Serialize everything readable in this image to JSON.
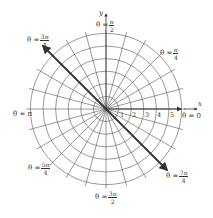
{
  "diagram": {
    "type": "polar-coordinate-grid",
    "center": {
      "x": 106,
      "y": 109
    },
    "unit_px": 12.6,
    "circle_count": 6,
    "radial_line_count": 24,
    "radial_step_degrees": 15,
    "colors": {
      "grid": "#555555",
      "axis": "#333333",
      "arrow": "#333333",
      "text": "#333333",
      "background": "#ffffff"
    },
    "axes": {
      "x_label": "x",
      "y_label": "y"
    },
    "ticks": [
      "1",
      "2",
      "3",
      "4",
      "5"
    ],
    "angle_labels": [
      {
        "id": "theta-pi-over-2",
        "prefix": "θ =",
        "num": "π",
        "den": "2",
        "angle": "π/2"
      },
      {
        "id": "theta-pi-over-4",
        "prefix": "θ =",
        "num": "π",
        "den": "4",
        "angle": "π/4"
      },
      {
        "id": "theta-3pi-over-4",
        "prefix": "θ =",
        "num": "3π",
        "den": "4",
        "angle": "3π/4"
      },
      {
        "id": "theta-pi",
        "text": "θ = π",
        "angle": "π"
      },
      {
        "id": "theta-0",
        "text": "θ = 0",
        "angle": "0"
      },
      {
        "id": "theta-5pi-over-4",
        "prefix": "θ =",
        "num": "5π",
        "den": "4",
        "angle": "5π/4"
      },
      {
        "id": "theta-7pi-over-4",
        "prefix": "θ =",
        "num": "7π",
        "den": "4",
        "angle": "7π/4"
      },
      {
        "id": "theta-3pi-over-2",
        "prefix": "θ =",
        "num": "3π",
        "den": "2",
        "angle": "3π/2"
      }
    ],
    "rays": [
      {
        "id": "ray-3pi-over-4",
        "angle": "3π/4",
        "style": "bold-arrow"
      },
      {
        "id": "ray-7pi-over-4",
        "angle": "7π/4",
        "style": "bold-arrow"
      },
      {
        "id": "ray-0",
        "angle": "0",
        "style": "axis-arrow"
      }
    ]
  }
}
